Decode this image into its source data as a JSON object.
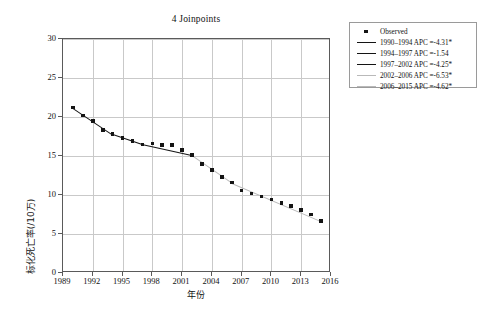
{
  "chart_data": {
    "type": "line",
    "title": "4 Joinpoints",
    "xlabel": "年份",
    "ylabel": "标化死亡率(/10万)",
    "xlim": [
      1989,
      2016
    ],
    "ylim": [
      0,
      30
    ],
    "xticks": [
      1989,
      1992,
      1995,
      1998,
      2001,
      2004,
      2007,
      2010,
      2013,
      2016
    ],
    "yticks": [
      0,
      5,
      10,
      15,
      20,
      25,
      30
    ],
    "grid": true,
    "legend_position": "outside-top-right",
    "x": [
      1990,
      1991,
      1992,
      1993,
      1994,
      1995,
      1996,
      1997,
      1998,
      1999,
      2000,
      2001,
      2002,
      2003,
      2004,
      2005,
      2006,
      2007,
      2008,
      2009,
      2010,
      2011,
      2012,
      2013,
      2014,
      2015
    ],
    "series": [
      {
        "name": "Observed",
        "values": [
          21.2,
          20.2,
          19.5,
          18.3,
          17.8,
          17.3,
          16.9,
          16.5,
          16.6,
          16.4,
          16.4,
          15.8,
          15.1,
          14.0,
          13.2,
          12.3,
          11.6,
          10.6,
          10.2,
          9.8,
          9.4,
          9.0,
          8.6,
          8.1,
          7.5,
          6.7
        ]
      }
    ],
    "joinpoints": [
      1994,
      1997,
      2002,
      2006
    ],
    "segments": [
      {
        "label": "1990-1994 APC =-4.31*",
        "start": 1990,
        "end": 1994,
        "apc": -4.31,
        "significant": true,
        "color": "#141414"
      },
      {
        "label": "1994-1997 APC =-1.54",
        "start": 1994,
        "end": 1997,
        "apc": -1.54,
        "significant": false,
        "color": "#141414"
      },
      {
        "label": "1997-2002 APC =-4.25*",
        "start": 1997,
        "end": 2002,
        "apc": -4.25,
        "significant": true,
        "color": "#141414"
      },
      {
        "label": "2002-2006 APC =-6.53*",
        "start": 2002,
        "end": 2006,
        "apc": -6.53,
        "significant": true,
        "color": "#b9b9b9"
      },
      {
        "label": "2006-2015 APC =-4.62*",
        "start": 2006,
        "end": 2015,
        "apc": -4.62,
        "significant": true,
        "color": "#b9b9b9"
      }
    ]
  },
  "legend": {
    "observed_label": "Observed",
    "items": [
      "1990–1994 APC =-4.31*",
      "1994–1997 APC =-1.54",
      "1997–2002 APC =-4.25*",
      "2002–2006 APC =-6.53*",
      "2006–2015 APC =-4.62*"
    ]
  },
  "axis": {
    "y_tick_labels": [
      "30",
      "25",
      "20",
      "15",
      "10",
      "5",
      "0"
    ],
    "x_tick_labels": [
      "1989",
      "1992",
      "1995",
      "1998",
      "2001",
      "2004",
      "2007",
      "2010",
      "2013",
      "2016"
    ]
  }
}
